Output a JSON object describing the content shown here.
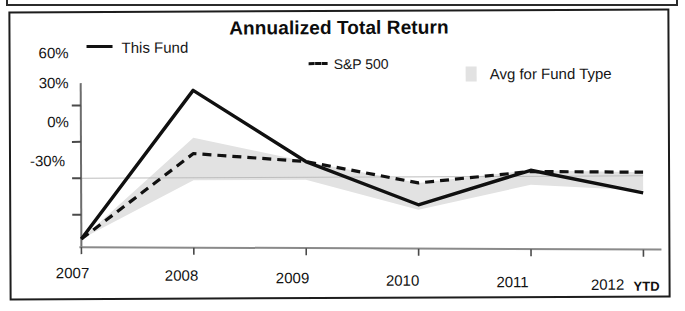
{
  "chart_data": {
    "type": "line",
    "title": "Annualized Total Return",
    "xlabel": "",
    "ylabel": "",
    "categories": [
      "2007",
      "2008",
      "2009",
      "2010",
      "2011",
      "2012"
    ],
    "x_axis_note": "YTD",
    "ytick_labels": [
      "60%",
      "30%",
      "0%",
      "-30%"
    ],
    "ytick_values": [
      60,
      30,
      0,
      -30
    ],
    "ylim": [
      -55,
      80
    ],
    "grid": false,
    "legend_position": "top",
    "series": [
      {
        "name": "This Fund",
        "style": "solid",
        "color": "#111111",
        "values": [
          -50,
          72,
          13,
          -23,
          5,
          -14
        ]
      },
      {
        "name": "S&P 500",
        "style": "dashed",
        "color": "#111111",
        "values": [
          -50,
          20,
          13,
          -5,
          4,
          3
        ]
      },
      {
        "name": "Avg for Fund Type",
        "style": "band",
        "color": "#e2e2e2",
        "band_upper": [
          -50,
          33,
          13,
          -5,
          5,
          3
        ],
        "band_lower": [
          -50,
          -2,
          -2,
          -27,
          -7,
          -12
        ]
      }
    ]
  },
  "chart": {
    "title": "Annualized Total Return",
    "legend": {
      "this_fund": "This Fund",
      "sp500": "S&P 500",
      "avg_fund_type": "Avg for Fund Type"
    },
    "y_axis": {
      "t0": "60%",
      "t1": "30%",
      "t2": "0%",
      "t3": "-30%"
    },
    "x_axis": {
      "t0": "2007",
      "t1": "2008",
      "t2": "2009",
      "t3": "2010",
      "t4": "2011",
      "t5": "2012",
      "ytd": "YTD"
    }
  }
}
